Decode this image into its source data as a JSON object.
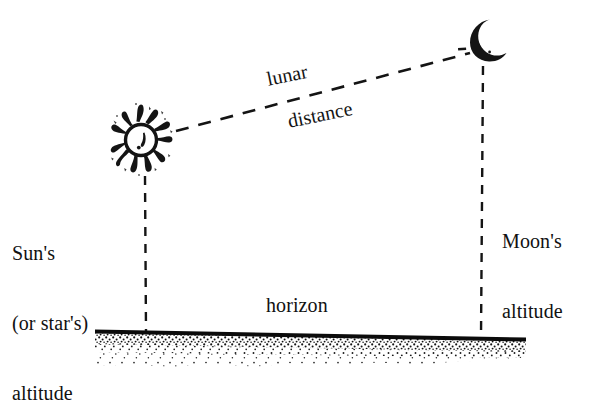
{
  "figure": {
    "title_visible": false,
    "background_color": "#ffffff",
    "ink_color": "#111111",
    "labels": {
      "lunar": "lunar",
      "distance": "distance",
      "horizon": "horizon",
      "sun_altitude_line1": "Sun's",
      "sun_altitude_line2": "(or star's)",
      "sun_altitude_line3": "altitude",
      "moon_altitude_line1": "Moon's",
      "moon_altitude_line2": "altitude"
    },
    "icons": {
      "sun": "sun-icon",
      "moon": "crescent-moon-icon"
    },
    "geometry": {
      "sun_center_x": 141,
      "sun_center_y": 140,
      "moon_center_x": 486,
      "moon_center_y": 40,
      "sun_vertical_line_x": 145,
      "sun_vertical_line_top_y": 176,
      "sun_vertical_line_bottom_y": 331,
      "moon_vertical_line_x": 482,
      "moon_vertical_line_top_y": 66,
      "moon_vertical_line_bottom_y": 338,
      "horizon_left_x": 95,
      "horizon_left_y": 330,
      "horizon_right_x": 526,
      "horizon_right_y": 338,
      "lunar_distance_start_x": 176,
      "lunar_distance_start_y": 131,
      "lunar_distance_end_x": 470,
      "lunar_distance_end_y": 53,
      "label_rotation_deg": -11.5
    }
  }
}
